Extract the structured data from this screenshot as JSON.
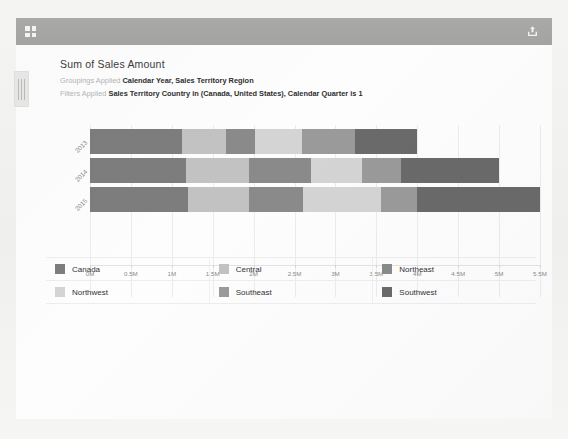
{
  "toolbar": {
    "expand_icon": "expand-icon",
    "share_icon": "share-icon"
  },
  "visual": {
    "title": "Sum of Sales Amount",
    "groupings_label": "Groupings Applied",
    "groupings_value": "Calendar Year, Sales Territory Region",
    "filters_label": "Filters Applied",
    "filters_value": "Sales Territory Country in (Canada, United States), Calendar Quarter is 1"
  },
  "chart_data": {
    "type": "bar",
    "orientation": "horizontal",
    "stacked": true,
    "title": "Sum of Sales Amount",
    "xlabel": "",
    "ylabel": "",
    "xlim": [
      0,
      5500000
    ],
    "grid": true,
    "legend_position": "bottom",
    "categories": [
      "2013",
      "2014",
      "2015"
    ],
    "tick_labels": [
      "0M",
      "0.5M",
      "1M",
      "1.5M",
      "2M",
      "2.5M",
      "3M",
      "3.5M",
      "4M",
      "4.5M",
      "5M",
      "5.5M"
    ],
    "tick_values": [
      0,
      500000,
      1000000,
      1500000,
      2000000,
      2500000,
      3000000,
      3500000,
      4000000,
      4500000,
      5000000,
      5500000
    ],
    "series": [
      {
        "name": "Canada",
        "color": "#7d7d7d",
        "values": [
          1130000,
          1170000,
          1200000
        ]
      },
      {
        "name": "Central",
        "color": "#c2c2c2",
        "values": [
          530000,
          770000,
          740000
        ]
      },
      {
        "name": "Northeast",
        "color": "#8a8a8a",
        "values": [
          360000,
          760000,
          660000
        ]
      },
      {
        "name": "Northwest",
        "color": "#d4d4d4",
        "values": [
          570000,
          620000,
          960000
        ]
      },
      {
        "name": "Southeast",
        "color": "#9a9a9a",
        "values": [
          650000,
          480000,
          440000
        ]
      },
      {
        "name": "Southwest",
        "color": "#6a6a6a",
        "values": [
          760000,
          1200000,
          1500000
        ]
      }
    ]
  },
  "legend": {
    "items": [
      {
        "label": "Canada",
        "color": "#7d7d7d"
      },
      {
        "label": "Central",
        "color": "#c2c2c2"
      },
      {
        "label": "Northeast",
        "color": "#8a8a8a"
      },
      {
        "label": "Northwest",
        "color": "#d4d4d4"
      },
      {
        "label": "Southeast",
        "color": "#9a9a9a"
      },
      {
        "label": "Southwest",
        "color": "#6a6a6a"
      }
    ]
  }
}
